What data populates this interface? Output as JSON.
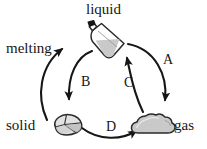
{
  "diagram": {
    "background_color": "#ffffff",
    "stroke_color": "#161616",
    "fill_gray": "#c9c9c9",
    "states": [
      {
        "id": "liquid",
        "label": "liquid",
        "icon": "flask-bottle-icon",
        "position": "top-center"
      },
      {
        "id": "solid",
        "label": "solid",
        "icon": "rock-crystal-icon",
        "position": "bottom-left"
      },
      {
        "id": "gas",
        "label": "gas",
        "icon": "cloud-icon",
        "position": "bottom-right"
      }
    ],
    "transitions": [
      {
        "id": "melting",
        "label": "melting",
        "from": "solid",
        "to": "liquid",
        "arrow": "left-outer-up"
      },
      {
        "id": "b",
        "label": "B",
        "from": "liquid",
        "to": "solid",
        "arrow": "left-inner-down"
      },
      {
        "id": "a",
        "label": "A",
        "from": "liquid",
        "to": "gas",
        "arrow": "right-outer-down"
      },
      {
        "id": "c",
        "label": "C",
        "from": "gas",
        "to": "liquid",
        "arrow": "right-inner-up"
      },
      {
        "id": "d",
        "label": "D",
        "from": "solid",
        "to": "gas",
        "arrow": "bottom-right"
      }
    ]
  }
}
